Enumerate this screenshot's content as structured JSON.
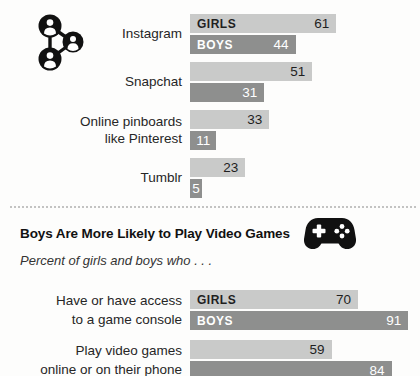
{
  "colors": {
    "girls_bar": "#c9cac9",
    "boys_bar": "#8e8f8e",
    "girls_text": "#1f1f1f",
    "boys_text": "#ffffff",
    "divider": "#c3c3c2",
    "icon": "#111111"
  },
  "icons": {
    "social": "social-network-icon",
    "gamepad": "gamepad-icon"
  },
  "section2": {
    "title": "Boys Are More Likely to Play Video Games",
    "subtitle": "Percent of girls and boys who . . ."
  },
  "chart_data": [
    {
      "type": "bar",
      "name": "social-media-platforms-girls-vs-boys",
      "orientation": "horizontal",
      "categories": [
        "Instagram",
        "Snapchat",
        "Online pinboards like Pinterest",
        "Tumblr"
      ],
      "categories_wrapped": [
        [
          "Instagram"
        ],
        [
          "Snapchat"
        ],
        [
          "Online pinboards",
          "like Pinterest"
        ],
        [
          "Tumblr"
        ]
      ],
      "series": [
        {
          "name": "GIRLS",
          "values": [
            61,
            51,
            33,
            23
          ],
          "color": "#c9cac9",
          "text_color": "#1f1f1f"
        },
        {
          "name": "BOYS",
          "values": [
            44,
            31,
            11,
            5
          ],
          "color": "#8e8f8e",
          "text_color": "#ffffff"
        }
      ],
      "xlim": [
        0,
        100
      ],
      "value_labels": "inside-end",
      "series_labels_on_first_row": true,
      "grid": false,
      "legend_position": "in-bar"
    },
    {
      "type": "bar",
      "name": "video-games-girls-vs-boys",
      "orientation": "horizontal",
      "title": "Boys Are More Likely to Play Video Games",
      "subtitle": "Percent of girls and boys who . . .",
      "categories": [
        "Have or have access to a game console",
        "Play video games online or on their phone"
      ],
      "categories_wrapped": [
        [
          "Have or have access",
          "to a game console"
        ],
        [
          "Play video games",
          "online or on their phone"
        ]
      ],
      "series": [
        {
          "name": "GIRLS",
          "values": [
            70,
            59
          ],
          "color": "#c9cac9",
          "text_color": "#1f1f1f"
        },
        {
          "name": "BOYS",
          "values": [
            91,
            84
          ],
          "color": "#8e8f8e",
          "text_color": "#ffffff"
        }
      ],
      "xlim": [
        0,
        100
      ],
      "value_labels": "inside-end",
      "series_labels_on_first_row": true,
      "grid": false,
      "legend_position": "in-bar"
    }
  ]
}
